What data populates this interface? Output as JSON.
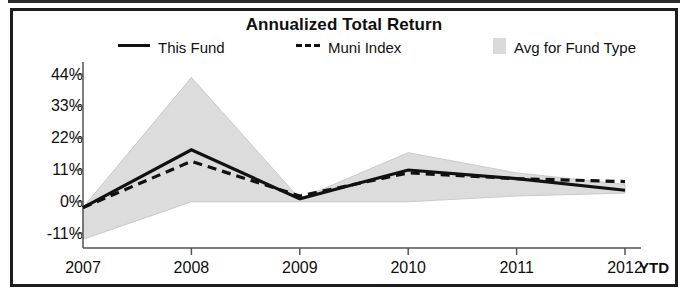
{
  "chart_data": {
    "type": "area",
    "title": "Annualized Total Return",
    "xlabel": "",
    "ylabel": "",
    "categories": [
      "2007",
      "2008",
      "2009",
      "2010",
      "2011",
      "2012"
    ],
    "x_axis_note": "YTD",
    "ylim": [
      -16,
      47
    ],
    "yticks": [
      -11,
      0,
      11,
      22,
      33,
      44
    ],
    "ytick_labels": [
      "-11%",
      "0%",
      "11%",
      "22%",
      "33%",
      "44%"
    ],
    "grid": false,
    "legend_position": "top",
    "series": [
      {
        "name": "This Fund",
        "style": "solid",
        "color": "#111111",
        "values": [
          -2,
          18,
          1,
          11,
          8,
          4
        ]
      },
      {
        "name": "Muni Index",
        "style": "dashed",
        "color": "#111111",
        "values": [
          -2,
          14,
          2,
          10,
          8,
          7
        ]
      },
      {
        "name": "Avg for Fund Type",
        "style": "band",
        "color": "#dcdcdc",
        "upper": [
          -2,
          43,
          1,
          17,
          10,
          6
        ],
        "lower": [
          -13,
          0,
          0,
          0,
          2,
          3
        ]
      }
    ]
  },
  "title": "Annualized Total Return",
  "legend": {
    "this_fund": "This Fund",
    "muni_index": "Muni Index",
    "avg_fund_type": "Avg for Fund Type"
  },
  "axes": {
    "y_labels": [
      "44%",
      "33%",
      "22%",
      "11%",
      "0%",
      "-11%"
    ],
    "x_labels": [
      "2007",
      "2008",
      "2009",
      "2010",
      "2011",
      "2012"
    ],
    "ytd": "YTD"
  },
  "colors": {
    "line": "#111111",
    "band": "#dcdcdc",
    "frame": "#1d1d1d",
    "background": "#ffffff"
  }
}
